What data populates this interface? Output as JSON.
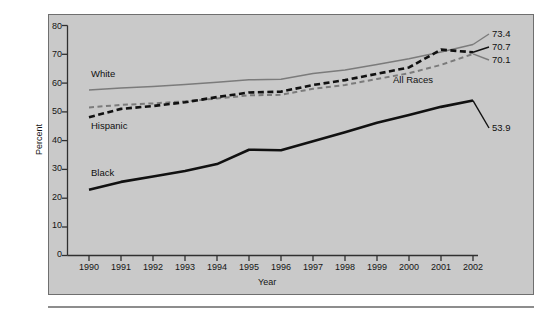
{
  "figure": {
    "background_color": "#ffffff",
    "panel_color": "#c9c9c9",
    "panel_border_color": "#6f6f6f"
  },
  "chart_data": {
    "type": "line",
    "title": "",
    "xlabel": "Year",
    "ylabel": "Percent",
    "categories": [
      "1990",
      "1991",
      "1992",
      "1993",
      "1994",
      "1995",
      "1996",
      "1997",
      "1998",
      "1999",
      "2000",
      "2001",
      "2002"
    ],
    "x": [
      1990,
      1991,
      1992,
      1993,
      1994,
      1995,
      1996,
      1997,
      1998,
      1999,
      2000,
      2001,
      2002
    ],
    "xlim": [
      1989.4,
      2002.6
    ],
    "ylim": [
      0,
      80
    ],
    "yticks": [
      0,
      10,
      20,
      30,
      40,
      50,
      60,
      70,
      80
    ],
    "xticks": [
      "1990",
      "1991",
      "1992",
      "1993",
      "1994",
      "1995",
      "1996",
      "1997",
      "1998",
      "1999",
      "2000",
      "2001",
      "2002"
    ],
    "grid": false,
    "legend_position": "inline-annotations",
    "series": [
      {
        "name": "White",
        "style": "solid",
        "color": "#7b7b7b",
        "width": 1.5,
        "label_text": "White",
        "end_value_label": "73.4",
        "values": [
          57.6,
          58.3,
          58.8,
          59.5,
          60.3,
          61.1,
          61.3,
          63.3,
          64.5,
          66.4,
          68.4,
          70.8,
          73.4
        ]
      },
      {
        "name": "All Races",
        "style": "dashed",
        "color": "#7b7b7b",
        "width": 2.0,
        "label_text": "All Races",
        "end_value_label": "70.1",
        "values": [
          51.5,
          52.4,
          52.9,
          53.6,
          54.6,
          55.7,
          55.9,
          58.0,
          59.3,
          61.4,
          63.4,
          66.3,
          70.1
        ]
      },
      {
        "name": "Hispanic",
        "style": "dashed",
        "color": "#111111",
        "width": 2.6,
        "label_text": "Hispanic",
        "end_value_label": "70.7",
        "values": [
          48.1,
          51.0,
          52.0,
          53.3,
          55.1,
          56.7,
          57.0,
          59.3,
          61.0,
          63.2,
          65.4,
          71.6,
          70.7
        ]
      },
      {
        "name": "Black",
        "style": "solid",
        "color": "#111111",
        "width": 2.6,
        "label_text": "Black",
        "end_value_label": "53.9",
        "values": [
          22.9,
          25.6,
          27.5,
          29.4,
          31.8,
          36.8,
          36.6,
          39.7,
          42.9,
          46.2,
          48.9,
          51.7,
          53.9
        ]
      }
    ],
    "annotations": [
      {
        "text": "White",
        "kind": "series-inline-label"
      },
      {
        "text": "Hispanic",
        "kind": "series-inline-label"
      },
      {
        "text": "Black",
        "kind": "series-inline-label"
      },
      {
        "text": "All Races",
        "kind": "series-inline-label"
      },
      {
        "text": "73.4",
        "kind": "end-value"
      },
      {
        "text": "70.7",
        "kind": "end-value"
      },
      {
        "text": "70.1",
        "kind": "end-value"
      },
      {
        "text": "53.9",
        "kind": "end-value"
      }
    ]
  }
}
